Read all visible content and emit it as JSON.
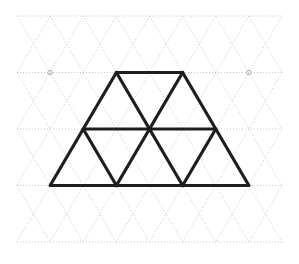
{
  "figure": {
    "background_color": "#ffffff",
    "grid": {
      "line_color": "#c9c9c9",
      "line_width": 1,
      "dash_pattern": "1,2",
      "cell_width": 66.25,
      "row_height": 56.5,
      "columns_x": [
        17,
        50.13,
        83.25,
        116.38,
        149.5,
        182.63,
        215.75,
        248.88,
        282
      ],
      "rows_y": [
        16,
        72.5,
        129,
        185.5,
        242
      ],
      "row_offset_parity": "even rows start on full column, odd rows offset by half cell",
      "horizontal_rows_drawn": [
        16,
        72.5,
        129,
        185.5,
        242
      ],
      "left_edge_x": 17,
      "right_edge_x": 282,
      "top_edge_y": 16,
      "bottom_edge_y": 242
    },
    "vertex_markers": {
      "color": "#b0b0b0",
      "radius": 2.2,
      "stroke_width": 1,
      "points": [
        {
          "x": 50.13,
          "y": 72.5,
          "name": "left-marker"
        },
        {
          "x": 248.88,
          "y": 72.5,
          "name": "right-marker"
        }
      ]
    },
    "bold_shape": {
      "name": "trapezoid-outline",
      "stroke_color": "#1e1e1e",
      "stroke_width": 3.2,
      "fill": "none",
      "outline_points": [
        {
          "x": 50.13,
          "y": 185.5
        },
        {
          "x": 116.38,
          "y": 72.5
        },
        {
          "x": 182.63,
          "y": 72.5
        },
        {
          "x": 248.88,
          "y": 185.5
        }
      ],
      "outline_closed": true,
      "interior_segments": [
        {
          "name": "middle-horizontal",
          "x1": 83.25,
          "y1": 129,
          "x2": 215.75,
          "y2": 129
        },
        {
          "name": "upper-left-diagonal",
          "x1": 116.38,
          "y1": 72.5,
          "x2": 149.5,
          "y2": 129
        },
        {
          "name": "upper-right-diagonal",
          "x1": 182.63,
          "y1": 72.5,
          "x2": 149.5,
          "y2": 129
        },
        {
          "name": "lower-left-diagonal",
          "x1": 83.25,
          "y1": 129,
          "x2": 116.38,
          "y2": 185.5
        },
        {
          "name": "lower-mid-left-diagonal",
          "x1": 149.5,
          "y1": 129,
          "x2": 116.38,
          "y2": 185.5
        },
        {
          "name": "lower-mid-right-diagonal",
          "x1": 149.5,
          "y1": 129,
          "x2": 182.63,
          "y2": 185.5
        },
        {
          "name": "lower-right-diagonal",
          "x1": 215.75,
          "y1": 129,
          "x2": 182.63,
          "y2": 185.5
        }
      ],
      "triangle_count": 8,
      "top_row_triangles": 3,
      "bottom_row_triangles": 5
    }
  },
  "chart_data": {
    "type": "diagram",
    "lattice_type": "isometric-triangular",
    "unit_edge_length": 66.25,
    "shape_vertices": [
      [
        50.13,
        185.5
      ],
      [
        116.38,
        72.5
      ],
      [
        182.63,
        72.5
      ],
      [
        248.88,
        185.5
      ]
    ],
    "unit_triangles_in_shape": 8,
    "legend": [],
    "xlabel": "",
    "ylabel": ""
  }
}
